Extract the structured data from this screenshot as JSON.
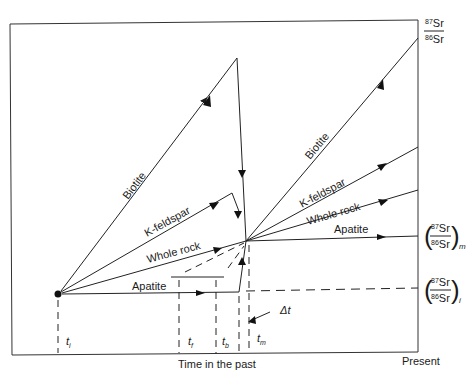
{
  "diagram": {
    "y_axis_label": {
      "numerator_sup": "87",
      "numerator": "Sr",
      "denominator_sup": "86",
      "denominator": "Sr"
    },
    "x_axis_label": "Time in the past",
    "x_axis_end_label": "Present",
    "lines": [
      {
        "name": "Biotite",
        "label": "Biotite"
      },
      {
        "name": "K-feldspar",
        "label": "K-feldspar"
      },
      {
        "name": "Whole rock",
        "label": "Whole rock"
      },
      {
        "name": "Apatite",
        "label": "Apatite"
      }
    ],
    "right_labels": {
      "measured": {
        "num_sup": "87",
        "num": "Sr",
        "den_sup": "86",
        "den": "Sr",
        "subscript": "m"
      },
      "initial": {
        "num_sup": "87",
        "num": "Sr",
        "den_sup": "86",
        "den": "Sr",
        "subscript": "i"
      }
    },
    "time_markers": [
      {
        "symbol": "t",
        "sub": "i"
      },
      {
        "symbol": "t",
        "sub": "f"
      },
      {
        "symbol": "t",
        "sub": "b"
      },
      {
        "symbol": "t",
        "sub": "m"
      }
    ],
    "delta_label": "Δt"
  }
}
